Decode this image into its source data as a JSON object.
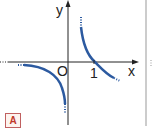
{
  "graph": {
    "y_label": "y",
    "x_label": "x",
    "origin_label": "O",
    "tick_label": "1",
    "badge": "A",
    "curve_color": "#2c5aa0",
    "function_type": "hyperbola-like decreasing branches with vertical asymptote at x=0, x-intercept at 1"
  }
}
